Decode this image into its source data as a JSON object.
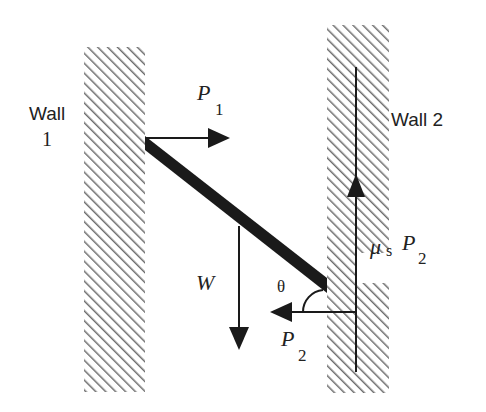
{
  "diagram": {
    "type": "free-body diagram",
    "walls": [
      {
        "id": "wall1",
        "label_line1": "Wall",
        "label_line2": "1"
      },
      {
        "id": "wall2",
        "label": "Wall 2"
      }
    ],
    "rod": {
      "description": "uniform rod leaning between two walls"
    },
    "forces": {
      "p1": {
        "symbol": "P",
        "subscript": "1",
        "direction": "right"
      },
      "weight": {
        "symbol": "W",
        "direction": "down"
      },
      "p2": {
        "symbol": "P",
        "subscript": "2",
        "direction": "left"
      },
      "friction": {
        "symbol": "μ",
        "sub": "s",
        "main": "P",
        "subscript": "2",
        "direction": "up"
      }
    },
    "angle": {
      "symbol": "θ"
    },
    "colors": {
      "ink": "#1a1a1a",
      "hatch": "#6e6e6e",
      "background": "#ffffff"
    }
  }
}
